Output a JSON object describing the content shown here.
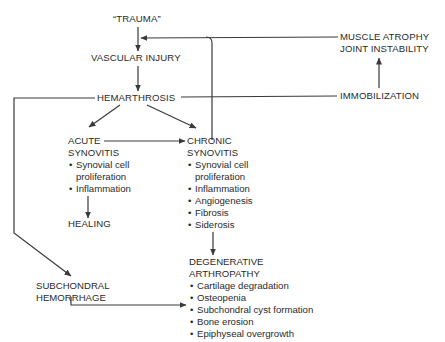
{
  "diagram": {
    "nodes": {
      "trauma": "“TRAUMA”",
      "vascular_injury": "VASCULAR INJURY",
      "hemarthrosis": "HEMARTHROSIS",
      "muscle_atrophy": "MUSCLE ATROPHY",
      "joint_instability": "JOINT INSTABILITY",
      "immobilization": "IMMOBILIZATION",
      "acute_synovitis": {
        "title_line1": "ACUTE",
        "title_line2": "SYNOVITIS",
        "items": [
          "Synovial cell",
          "Inflammation"
        ],
        "item0_cont": "proliferation"
      },
      "healing": "HEALING",
      "chronic_synovitis": {
        "title_line1": "CHRONIC",
        "title_line2": "SYNOVITIS",
        "items": [
          "Synovial cell",
          "Inflammation",
          "Angiogenesis",
          "Fibrosis",
          "Siderosis"
        ],
        "item0_cont": "proliferation"
      },
      "subchondral_hemorrhage": {
        "line1": "SUBCHONDRAL",
        "line2": "HEMORRHAGE"
      },
      "degenerative_arthropathy": {
        "title_line1": "DEGENERATIVE",
        "title_line2": "ARTHROPATHY",
        "items": [
          "Cartilage degradation",
          "Osteopenia",
          "Subchondral cyst formation",
          "Bone erosion",
          "Epiphyseal overgrowth"
        ]
      }
    },
    "edges": [
      {
        "from": "trauma",
        "to": "vascular_injury"
      },
      {
        "from": "vascular_injury",
        "to": "hemarthrosis"
      },
      {
        "from": "hemarthrosis",
        "to": "acute_synovitis"
      },
      {
        "from": "hemarthrosis",
        "to": "chronic_synovitis"
      },
      {
        "from": "hemarthrosis",
        "to": "immobilization"
      },
      {
        "from": "hemarthrosis",
        "to": "subchondral_hemorrhage"
      },
      {
        "from": "immobilization",
        "to": "muscle_atrophy"
      },
      {
        "from": "muscle_atrophy",
        "to": "vascular_injury"
      },
      {
        "from": "chronic_synovitis",
        "to": "vascular_injury"
      },
      {
        "from": "acute_synovitis",
        "to": "chronic_synovitis"
      },
      {
        "from": "acute_synovitis",
        "to": "healing"
      },
      {
        "from": "chronic_synovitis",
        "to": "degenerative_arthropathy"
      },
      {
        "from": "subchondral_hemorrhage",
        "to": "degenerative_arthropathy.subchondral_cyst_formation"
      }
    ],
    "line_color": "#3a3a3a"
  }
}
